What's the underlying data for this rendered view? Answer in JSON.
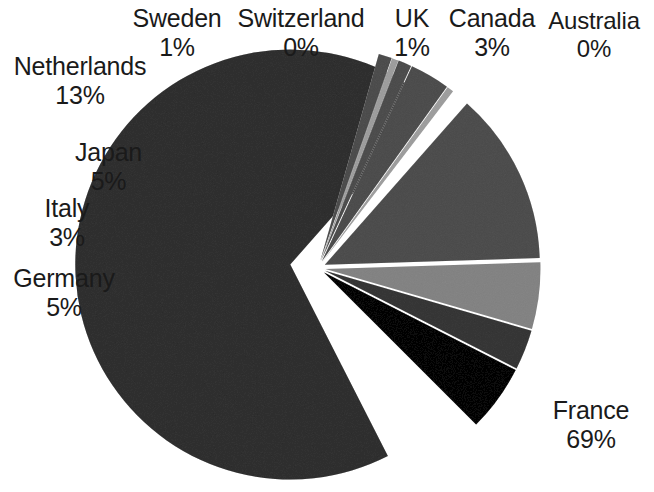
{
  "chart_data": {
    "type": "pie",
    "title": "",
    "subtitle": "",
    "xlabel": "",
    "ylabel": "",
    "legend": "none",
    "grid": false,
    "exploded": true,
    "label_format": "name + percent",
    "categories": [
      "France",
      "Netherlands",
      "Japan",
      "Germany",
      "Canada",
      "Italy",
      "Sweden",
      "UK",
      "Switzerland",
      "Australia"
    ],
    "values": [
      69,
      13,
      5,
      5,
      3,
      3,
      1,
      1,
      0,
      0
    ],
    "units": "%",
    "slices": [
      {
        "name": "France",
        "value": 69,
        "percent": "69%",
        "color": "#6e6e6e",
        "start_deg": 63.0,
        "end_deg": 311.4,
        "explode": 0.13
      },
      {
        "name": "Netherlands",
        "value": 13,
        "percent": "13%",
        "color": "#8c8c8c",
        "start_deg": 311.4,
        "end_deg": 358.2,
        "explode": 0.035
      },
      {
        "name": "Japan",
        "value": 5,
        "percent": "5%",
        "color": "#b7b7b7",
        "start_deg": 358.2,
        "end_deg": 376.2,
        "explode": 0.035
      },
      {
        "name": "Italy",
        "value": 3,
        "percent": "3%",
        "color": "#757575",
        "start_deg": 376.2,
        "end_deg": 387.0,
        "explode": 0.035
      },
      {
        "name": "Germany",
        "value": 5,
        "percent": "5%",
        "color": "#2f2f2f",
        "start_deg": 387.0,
        "end_deg": 405.0,
        "explode": 0.035
      },
      {
        "name": "Sweden",
        "value": 1,
        "percent": "1%",
        "color": "#8c8c8c",
        "start_deg": 285.8,
        "end_deg": 289.4,
        "explode": 0.035
      },
      {
        "name": "Switzerland",
        "value": 0,
        "percent": "0%",
        "color": "#c9c9c9",
        "start_deg": 289.4,
        "end_deg": 291.2,
        "explode": 0.035
      },
      {
        "name": "UK",
        "value": 1,
        "percent": "1%",
        "color": "#8c8c8c",
        "start_deg": 291.2,
        "end_deg": 294.8,
        "explode": 0.035
      },
      {
        "name": "Canada",
        "value": 3,
        "percent": "3%",
        "color": "#8c8c8c",
        "start_deg": 294.8,
        "end_deg": 305.6,
        "explode": 0.035
      },
      {
        "name": "Australia",
        "value": 0,
        "percent": "0%",
        "color": "#c9c9c9",
        "start_deg": 305.6,
        "end_deg": 307.4,
        "explode": 0.035
      }
    ]
  },
  "labels": {
    "netherlands": {
      "name": "Netherlands",
      "value": "13%"
    },
    "sweden": {
      "name": "Sweden",
      "value": "1%"
    },
    "switzerland": {
      "name": "Switzerland",
      "value": "0%"
    },
    "uk": {
      "name": "UK",
      "value": "1%"
    },
    "canada": {
      "name": "Canada",
      "value": "3%"
    },
    "australia": {
      "name": "Australia",
      "value": "0%"
    },
    "japan": {
      "name": "Japan",
      "value": "5%"
    },
    "italy": {
      "name": "Italy",
      "value": "3%"
    },
    "germany": {
      "name": "Germany",
      "value": "5%"
    },
    "france": {
      "name": "France",
      "value": "69%"
    }
  },
  "colors": {
    "background": "#ffffff",
    "text": "#1a1a1a",
    "france": "#6e6e6e",
    "netherlands": "#8c8c8c",
    "japan": "#b7b7b7",
    "italy": "#757575",
    "germany": "#2f2f2f",
    "pale": "#c9c9c9"
  }
}
